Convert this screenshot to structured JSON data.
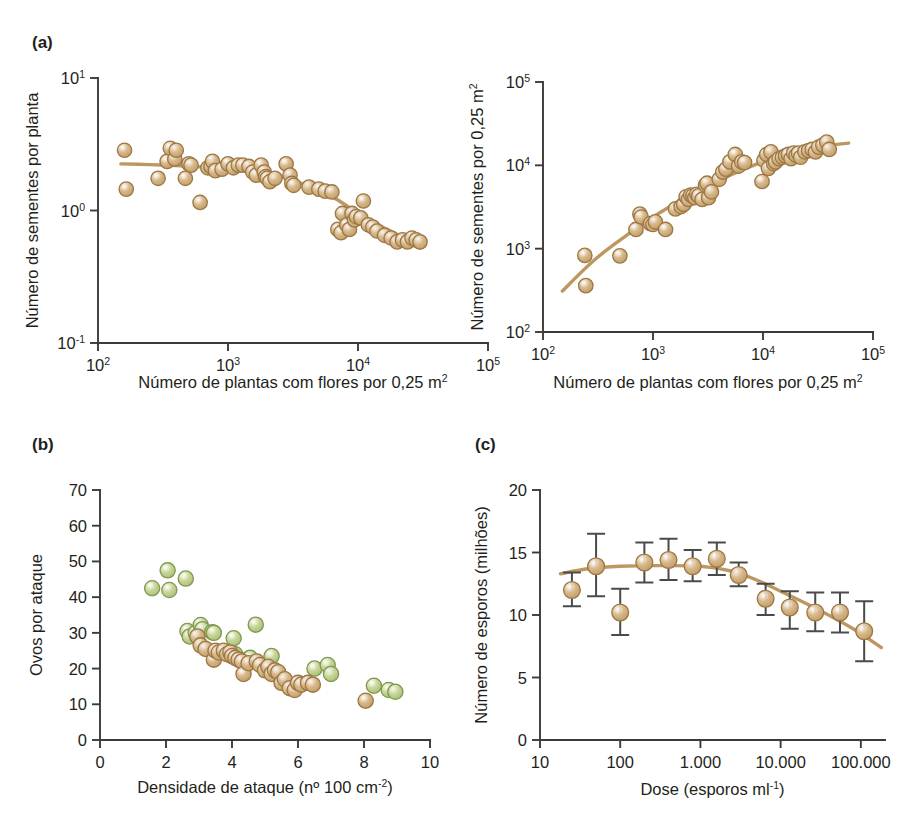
{
  "figure": {
    "background": "#ffffff",
    "marker_tan_fill": "#d8b98c",
    "marker_tan_edge": "#9c7744",
    "marker_green_fill": "#c9d79a",
    "marker_green_edge": "#7f9950",
    "curve_color": "#bd9761",
    "axis_color": "#3b3b3b",
    "errorbar_color": "#4a4a4a"
  },
  "panels": {
    "a_left": {
      "label": "(a)",
      "ylabel": "Número de sementes por planta",
      "xlabel_parts": {
        "main": "Número de plantas com flores por 0,25 m",
        "sup": "2"
      },
      "chart_data": {
        "type": "scatter",
        "title": "",
        "xlabel": "Número de plantas com flores por 0,25 m²",
        "ylabel": "Número de sementes por planta",
        "xscale": "log",
        "yscale": "log",
        "xlim": [
          100,
          100000
        ],
        "ylim": [
          0.1,
          10
        ],
        "xticks": [
          100,
          1000,
          10000,
          100000
        ],
        "xtick_labels": [
          "10²",
          "10³",
          "10⁴",
          "10⁵"
        ],
        "yticks": [
          0.1,
          1,
          10
        ],
        "ytick_labels": [
          "10⁻¹",
          "10⁰",
          "10¹"
        ],
        "grid": false,
        "legend": "none",
        "series": [
          {
            "name": "sementes por planta",
            "color": "#d8b98c",
            "x": [
              160,
              165,
              290,
              340,
              360,
              390,
              400,
              470,
              500,
              520,
              610,
              700,
              740,
              760,
              800,
              900,
              1000,
              1100,
              1200,
              1300,
              1450,
              1550,
              1650,
              1800,
              1900,
              1950,
              2000,
              2100,
              2300,
              2800,
              3000,
              3100,
              3200,
              4200,
              5000,
              5600,
              6300,
              7000,
              7400,
              7600,
              8200,
              8600,
              9000,
              9400,
              9700,
              10500,
              11000,
              12000,
              13000,
              14000,
              16000,
              18000,
              20000,
              22000,
              24000,
              26000,
              28000,
              30000
            ],
            "y": [
              2.85,
              1.45,
              1.75,
              2.35,
              2.95,
              2.45,
              2.85,
              1.75,
              2.25,
              2.2,
              1.15,
              2.1,
              2.15,
              2.35,
              2.0,
              2.05,
              2.25,
              2.1,
              2.2,
              2.2,
              2.15,
              1.95,
              1.85,
              2.2,
              1.95,
              1.8,
              1.75,
              1.65,
              1.75,
              2.25,
              1.85,
              1.6,
              1.55,
              1.5,
              1.45,
              1.4,
              1.38,
              0.72,
              0.68,
              0.95,
              0.78,
              0.72,
              0.95,
              0.85,
              0.9,
              0.88,
              1.18,
              0.78,
              0.75,
              0.7,
              0.65,
              0.62,
              0.58,
              0.6,
              0.58,
              0.62,
              0.6,
              0.58
            ]
          }
        ],
        "fit_curve": {
          "x": [
            150,
            250,
            400,
            700,
            1000,
            1500,
            2000,
            3000,
            5000,
            7000,
            10000,
            15000,
            20000,
            30000
          ],
          "y": [
            2.25,
            2.22,
            2.18,
            2.12,
            2.08,
            1.98,
            1.9,
            1.72,
            1.42,
            1.2,
            0.95,
            0.76,
            0.66,
            0.52
          ]
        }
      }
    },
    "a_right": {
      "label": "",
      "ylabel_parts": {
        "main": "Número de sementes por 0,25 m",
        "sup": "2"
      },
      "xlabel_parts": {
        "main": "Número de plantas com flores por 0,25 m",
        "sup": "2"
      },
      "chart_data": {
        "type": "scatter",
        "title": "",
        "xlabel": "Número de plantas com flores por 0,25 m²",
        "ylabel": "Número de sementes por 0,25 m²",
        "xscale": "log",
        "yscale": "log",
        "xlim": [
          100,
          100000
        ],
        "ylim": [
          100,
          100000
        ],
        "xticks": [
          100,
          1000,
          10000,
          100000
        ],
        "xtick_labels": [
          "10²",
          "10³",
          "10⁴",
          "10⁵"
        ],
        "yticks": [
          100,
          1000,
          10000,
          100000
        ],
        "ytick_labels": [
          "10²",
          "10³",
          "10⁴",
          "10⁵"
        ],
        "grid": false,
        "legend": "none",
        "series": [
          {
            "name": "sementes por 0,25 m²",
            "color": "#d8b98c",
            "x": [
              240,
              245,
              500,
              700,
              760,
              780,
              950,
              1000,
              1050,
              1300,
              1600,
              1800,
              1900,
              2000,
              2100,
              2200,
              2300,
              2400,
              2500,
              2600,
              2800,
              3000,
              3100,
              3200,
              3400,
              4000,
              4300,
              4600,
              5000,
              5600,
              6000,
              6400,
              6800,
              9800,
              10200,
              10800,
              11200,
              11800,
              12500,
              13000,
              14000,
              15000,
              16000,
              17000,
              18000,
              19000,
              20000,
              21000,
              22000,
              24000,
              26000,
              28000,
              30000,
              32000,
              35000,
              38000,
              40000
            ],
            "y": [
              830,
              360,
              820,
              1700,
              2600,
              2400,
              2000,
              1950,
              2100,
              1700,
              3000,
              3200,
              3400,
              4200,
              3900,
              4400,
              4300,
              4100,
              4500,
              4300,
              3900,
              5800,
              6100,
              4100,
              4800,
              6800,
              8300,
              9000,
              11000,
              13500,
              9800,
              11000,
              10800,
              6400,
              11500,
              13500,
              9200,
              14500,
              10500,
              11000,
              12000,
              12500,
              13000,
              13500,
              12000,
              14000,
              13200,
              14000,
              12500,
              14500,
              15000,
              15500,
              14500,
              16500,
              17500,
              19000,
              15500
            ]
          }
        ],
        "fit_curve": {
          "x": [
            150,
            300,
            600,
            1000,
            2000,
            4000,
            7000,
            12000,
            20000,
            35000,
            60000
          ],
          "y": [
            310,
            750,
            1500,
            2400,
            4100,
            6600,
            9200,
            12000,
            14500,
            17000,
            18500
          ]
        }
      }
    },
    "b": {
      "label": "(b)",
      "ylabel": "Ovos por ataque",
      "xlabel_parts": {
        "main": "Densidade de ataque (nº 100 cm",
        "sup": "-2",
        "tail": ")"
      },
      "chart_data": {
        "type": "scatter",
        "title": "",
        "xlabel": "Densidade de ataque (nº 100 cm⁻²)",
        "ylabel": "Ovos por ataque",
        "xscale": "linear",
        "yscale": "linear",
        "xlim": [
          0,
          10
        ],
        "ylim": [
          0,
          70
        ],
        "xticks": [
          0,
          2,
          4,
          6,
          8,
          10
        ],
        "xtick_labels": [
          "0",
          "2",
          "4",
          "6",
          "8",
          "10"
        ],
        "yticks": [
          0,
          10,
          20,
          30,
          40,
          50,
          60,
          70
        ],
        "ytick_labels": [
          "0",
          "10",
          "20",
          "30",
          "40",
          "50",
          "60",
          "70"
        ],
        "grid": false,
        "legend": "none",
        "series": [
          {
            "name": "verde",
            "color": "#c9d79a",
            "x": [
              1.58,
              2.05,
              2.1,
              2.6,
              2.65,
              2.72,
              2.9,
              3.05,
              3.1,
              3.4,
              3.45,
              4.05,
              4.1,
              4.45,
              4.55,
              4.72,
              5.2,
              6.5,
              6.9,
              7.0,
              8.3,
              8.75,
              8.95
            ],
            "y": [
              42.5,
              47.5,
              42.0,
              45.2,
              30.5,
              29.0,
              30.0,
              32.2,
              31.0,
              30.2,
              30.0,
              28.5,
              24.0,
              22.5,
              23.0,
              32.3,
              23.5,
              20.0,
              21.0,
              18.5,
              15.2,
              14.0,
              13.5
            ]
          },
          {
            "name": "marrom",
            "color": "#d8b98c",
            "x": [
              2.95,
              3.05,
              3.2,
              3.45,
              3.5,
              3.6,
              3.75,
              3.85,
              3.95,
              4.0,
              4.1,
              4.2,
              4.3,
              4.35,
              4.5,
              4.75,
              4.85,
              5.0,
              5.1,
              5.2,
              5.3,
              5.4,
              5.5,
              5.6,
              5.75,
              5.9,
              6.0,
              6.1,
              6.3,
              6.45,
              8.05
            ],
            "y": [
              29.0,
              26.5,
              25.5,
              22.5,
              25.0,
              24.5,
              25.0,
              24.0,
              24.5,
              23.5,
              23.0,
              22.5,
              22.0,
              18.5,
              21.5,
              22.0,
              21.0,
              19.5,
              20.5,
              18.5,
              19.5,
              19.0,
              16.0,
              17.0,
              14.5,
              14.0,
              16.0,
              15.5,
              16.0,
              15.5,
              11.0
            ]
          }
        ]
      }
    },
    "c": {
      "label": "(c)",
      "ylabel": "Número de esporos (milhões)",
      "xlabel_parts": {
        "main": "Dose (esporos ml",
        "sup": "-1",
        "tail": ")"
      },
      "chart_data": {
        "type": "scatter",
        "title": "",
        "xlabel": "Dose (esporos ml⁻¹)",
        "ylabel": "Número de esporos (milhões)",
        "xscale": "log",
        "yscale": "linear",
        "xlim": [
          10,
          200000
        ],
        "ylim": [
          0,
          20
        ],
        "xticks": [
          10,
          100,
          1000,
          10000,
          100000
        ],
        "xtick_labels": [
          "10",
          "100",
          "1.000",
          "10.000",
          "100.000"
        ],
        "yticks": [
          0,
          5,
          10,
          15,
          20
        ],
        "ytick_labels": [
          "0",
          "5",
          "10",
          "15",
          "20"
        ],
        "grid": false,
        "legend": "none",
        "series": [
          {
            "name": "esporos",
            "color": "#d8b98c",
            "x": [
              25,
              50,
              100,
              200,
              400,
              800,
              1600,
              3000,
              6500,
              13000,
              27000,
              55000,
              110000
            ],
            "y": [
              12.0,
              13.9,
              10.2,
              14.2,
              14.4,
              13.9,
              14.5,
              13.2,
              11.3,
              10.6,
              10.2,
              10.2,
              8.7
            ],
            "err_low": [
              1.3,
              2.4,
              1.8,
              1.6,
              1.6,
              1.2,
              1.3,
              0.9,
              1.3,
              1.7,
              1.5,
              1.6,
              2.4
            ],
            "err_high": [
              1.4,
              2.6,
              1.9,
              1.6,
              1.7,
              1.3,
              1.3,
              1.0,
              1.2,
              1.3,
              1.6,
              1.6,
              2.4
            ]
          }
        ],
        "fit_curve": {
          "x": [
            18,
            40,
            100,
            300,
            1000,
            2500,
            5000,
            10000,
            30000,
            80000,
            180000
          ],
          "y": [
            13.3,
            13.7,
            13.9,
            13.95,
            13.9,
            13.5,
            12.8,
            11.9,
            10.4,
            8.9,
            7.4
          ]
        }
      }
    }
  }
}
